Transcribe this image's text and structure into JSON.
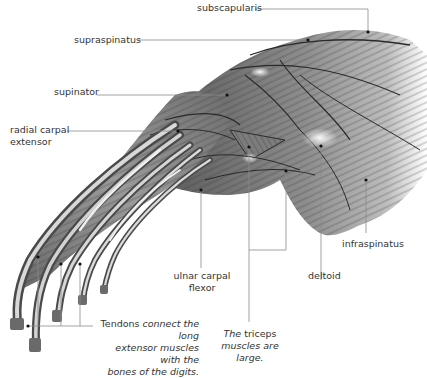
{
  "labels": {
    "subscapularis": "subscapularis",
    "supraspinatus": "supraspinatus",
    "supinator": "supinator",
    "radial_carpal_extensor_1": "radial carpal",
    "radial_carpal_extensor_2": "extensor",
    "ulnar_carpal_flexor_1": "ulnar carpal",
    "ulnar_carpal_flexor_2": "flexor",
    "deltoid": "deltoid",
    "infraspinatus": "infraspinatus"
  },
  "captions": {
    "tendons": {
      "bold": "Tendons",
      "line1_rest": "connect the long",
      "line2": "extensor muscles with the",
      "line3": "bones of the digits."
    },
    "triceps": {
      "italic_prefix": "The",
      "normal": "triceps",
      "line2": "muscles are large."
    }
  },
  "colors": {
    "leader_line": "#8a8a8a",
    "muscle_dark": "#3c3c3c",
    "muscle_mid": "#8c8c8c",
    "muscle_light": "#e6e6e6"
  }
}
